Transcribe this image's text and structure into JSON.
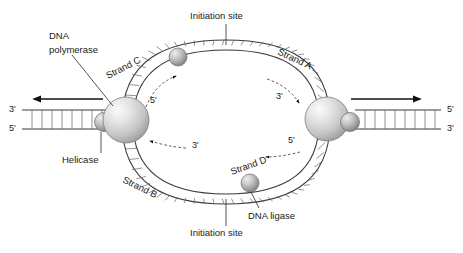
{
  "figure": {
    "background_color": "#ffffff",
    "width": 463,
    "height": 253
  },
  "labels": {
    "initiation_site_top": "Initiation site",
    "initiation_site_bottom": "Initiation site",
    "dna_polymerase_line1": "DNA",
    "dna_polymerase_line2": "polymerase",
    "helicase": "Helicase",
    "dna_ligase": "DNA ligase",
    "strand_a": "Strand A",
    "strand_b": "Strand B",
    "strand_c": "Strand C",
    "strand_d": "Strand D"
  },
  "ends": {
    "left_top": "3'",
    "left_bottom": "5'",
    "right_top": "5'",
    "right_bottom": "3'"
  },
  "inner_polarity": {
    "top_left": "5'",
    "top_right": "3'",
    "bottom_left": "3'",
    "bottom_right": "5'"
  },
  "colors": {
    "outline": "#3a3a3a",
    "rung": "#6e6e6e",
    "text": "#1a1a1a",
    "leader": "#2b2b2b",
    "arrow": "#111111",
    "sphere_light": "#f2f2f2",
    "sphere_mid": "#c9c9c9",
    "sphere_dark": "#8a8a8a",
    "small_sphere_light": "#e0e0e0",
    "small_sphere_dark": "#6f6f6f",
    "background": "#ffffff"
  },
  "elements": {
    "polymerase_left_name": "dna-polymerase-left",
    "polymerase_right_name": "dna-polymerase-right",
    "helicase_left_name": "helicase-left",
    "helicase_right_name": "helicase-right",
    "ligase_top_name": "ligase-top",
    "ligase_bottom_name": "ligase-bottom"
  }
}
